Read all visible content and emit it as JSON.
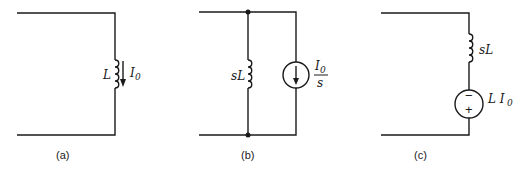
{
  "figure": {
    "circuits": [
      {
        "id": "a",
        "caption": "(a)",
        "inductor_label": "L",
        "current_label": "I",
        "current_sub": "0"
      },
      {
        "id": "b",
        "caption": "(b)",
        "inductor_label": "sL",
        "source_num": "I",
        "source_num_sub": "0",
        "source_den": "s"
      },
      {
        "id": "c",
        "caption": "(c)",
        "inductor_label": "sL",
        "source_label": "L I",
        "source_label_sub": "0",
        "minus_sign": "−",
        "plus_sign": "+"
      }
    ]
  }
}
